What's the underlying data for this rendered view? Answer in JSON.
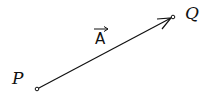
{
  "diagram": {
    "type": "vector",
    "start_point": {
      "label": "P",
      "x": 37,
      "y": 90
    },
    "end_point": {
      "label": "Q",
      "x": 173,
      "y": 17
    },
    "vector": {
      "label": "A",
      "has_arrow_over_label": true
    },
    "colors": {
      "stroke": "#111111",
      "background": "#ffffff"
    }
  }
}
